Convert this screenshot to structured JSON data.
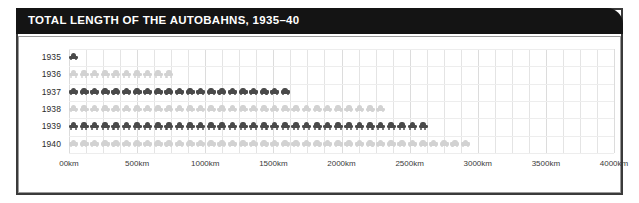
{
  "header": {
    "title": "TOTAL LENGTH OF THE AUTOBAHNS, 1935–40"
  },
  "chart_data": {
    "type": "bar",
    "subtype": "isotype-pictogram",
    "title": "TOTAL LENGTH OF THE AUTOBAHNS, 1935–40",
    "xlabel": "",
    "ylabel": "",
    "orientation": "horizontal",
    "categories": [
      "1935",
      "1936",
      "1937",
      "1938",
      "1939",
      "1940"
    ],
    "values": [
      100,
      1000,
      2100,
      3000,
      3400,
      3800
    ],
    "unit": "km",
    "icon_unit_value": 100,
    "icon_name": "car-icon",
    "icon_counts": [
      1,
      10,
      21,
      30,
      34,
      38
    ],
    "row_colors": [
      "#4a4a4a",
      "#d2d2d2",
      "#4a4a4a",
      "#d2d2d2",
      "#4a4a4a",
      "#d2d2d2"
    ],
    "xlim": [
      0,
      4000
    ],
    "xticks": [
      0,
      500,
      1000,
      1500,
      2000,
      2500,
      3000,
      3500,
      4000
    ],
    "xtick_labels": [
      "00km",
      "500km",
      "1000km",
      "1500km",
      "2000km",
      "2500km",
      "3000km",
      "3500km",
      "4000km"
    ],
    "minor_gridline_step": 125,
    "grid": true,
    "legend": null,
    "accent_color": "#141414",
    "panel_border_color": "#9a9a9a",
    "frame_color": "#3a3a3a"
  }
}
